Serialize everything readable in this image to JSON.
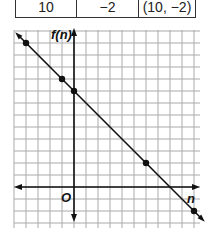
{
  "table": {
    "rows": [
      {
        "n": "10",
        "f_n": "−2",
        "pair": "(10, −2)"
      }
    ]
  },
  "chart_data": {
    "type": "line",
    "title": "",
    "xlabel": "n",
    "ylabel": "f(n)",
    "origin_label": "O",
    "function": "f(n) = 8 - n",
    "points": [
      {
        "x": -4,
        "y": 12
      },
      {
        "x": -1,
        "y": 9
      },
      {
        "x": 0,
        "y": 8
      },
      {
        "x": 6,
        "y": 2
      },
      {
        "x": 10,
        "y": -2
      }
    ],
    "line": {
      "x": [
        -5,
        11
      ],
      "y": [
        13,
        -3
      ]
    },
    "xlim": [
      -5,
      10
    ],
    "ylim": [
      -3,
      13
    ],
    "grid": true,
    "grid_step": 1,
    "legend": null
  },
  "labels": {
    "y_axis": "f(n)",
    "x_axis": "n",
    "origin": "O"
  }
}
